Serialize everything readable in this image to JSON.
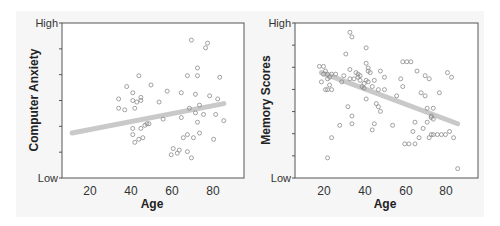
{
  "chart_data": [
    {
      "type": "scatter",
      "title": "",
      "xlabel": "Age",
      "ylabel": "Computer Anxiety",
      "xticks": [
        20,
        40,
        60,
        80
      ],
      "xlim": [
        6,
        96
      ],
      "yticks_labels": {
        "low": "Low",
        "high": "High"
      },
      "ylim": [
        0,
        10
      ],
      "y_minor_ticks": 5,
      "grid": false,
      "trend": {
        "direction": "positive",
        "x_start": 11,
        "y_start": 2.9,
        "x_end": 86,
        "y_end": 4.8
      },
      "points": [
        [
          34,
          5.1
        ],
        [
          34,
          4.5
        ],
        [
          37,
          4.4
        ],
        [
          38,
          5.9
        ],
        [
          41,
          5.5
        ],
        [
          41,
          5.0
        ],
        [
          42,
          4.5
        ],
        [
          43,
          4.9
        ],
        [
          44,
          6.6
        ],
        [
          45,
          5.2
        ],
        [
          45,
          5.0
        ],
        [
          50,
          6.0
        ],
        [
          54,
          4.9
        ],
        [
          58,
          5.6
        ],
        [
          65,
          5.5
        ],
        [
          68,
          6.6
        ],
        [
          70,
          8.9
        ],
        [
          77,
          8.4
        ],
        [
          78,
          8.7
        ],
        [
          73,
          7.1
        ],
        [
          73,
          6.6
        ],
        [
          84,
          6.5
        ],
        [
          79,
          5.3
        ],
        [
          83,
          5.1
        ],
        [
          72,
          5.4
        ],
        [
          69,
          4.5
        ],
        [
          72,
          4.2
        ],
        [
          74,
          4.7
        ],
        [
          76,
          4.1
        ],
        [
          82,
          4.1
        ],
        [
          86,
          3.7
        ],
        [
          73,
          3.6
        ],
        [
          65,
          3.9
        ],
        [
          56,
          3.8
        ],
        [
          41,
          3.2
        ],
        [
          45,
          3.2
        ],
        [
          47,
          3.4
        ],
        [
          48,
          3.5
        ],
        [
          49,
          3.5
        ],
        [
          41,
          2.8
        ],
        [
          42,
          2.3
        ],
        [
          44,
          2.5
        ],
        [
          46,
          2.6
        ],
        [
          66,
          2.6
        ],
        [
          68,
          2.8
        ],
        [
          71,
          2.6
        ],
        [
          74,
          2.9
        ],
        [
          81,
          2.5
        ],
        [
          61,
          1.9
        ],
        [
          63,
          1.6
        ],
        [
          64,
          1.8
        ],
        [
          60,
          1.5
        ],
        [
          68,
          1.7
        ],
        [
          70,
          1.3
        ]
      ]
    },
    {
      "type": "scatter",
      "title": "",
      "xlabel": "Age",
      "ylabel": "Memory Scores",
      "xticks": [
        20,
        40,
        60,
        80
      ],
      "xlim": [
        6,
        96
      ],
      "yticks_labels": {
        "low": "Low",
        "high": "High"
      },
      "ylim": [
        0,
        10
      ],
      "y_minor_ticks": 6,
      "grid": false,
      "trend": {
        "direction": "negative",
        "x_start": 19,
        "y_start": 6.8,
        "x_end": 86,
        "y_end": 3.5
      },
      "points": [
        [
          18,
          7.2
        ],
        [
          20,
          7.2
        ],
        [
          19,
          6.2
        ],
        [
          20,
          6.7
        ],
        [
          21,
          6.9
        ],
        [
          22,
          6.7
        ],
        [
          22,
          6.4
        ],
        [
          23,
          6.0
        ],
        [
          21,
          5.7
        ],
        [
          22,
          5.7
        ],
        [
          24,
          5.7
        ],
        [
          23,
          6.5
        ],
        [
          24,
          6.7
        ],
        [
          26,
          6.7
        ],
        [
          24,
          2.6
        ],
        [
          22,
          1.3
        ],
        [
          28,
          3.4
        ],
        [
          29,
          6.2
        ],
        [
          30,
          6.6
        ],
        [
          31,
          8.0
        ],
        [
          32,
          4.6
        ],
        [
          33,
          6.4
        ],
        [
          33,
          7.0
        ],
        [
          33,
          9.4
        ],
        [
          34,
          9.1
        ],
        [
          34,
          3.5
        ],
        [
          34,
          4.0
        ],
        [
          35,
          6.4
        ],
        [
          36,
          6.8
        ],
        [
          37,
          6.5
        ],
        [
          37,
          6.7
        ],
        [
          38,
          6.3
        ],
        [
          38,
          6.6
        ],
        [
          39,
          5.9
        ],
        [
          40,
          6.1
        ],
        [
          40,
          5.8
        ],
        [
          41,
          6.3
        ],
        [
          41,
          8.4
        ],
        [
          41,
          7.4
        ],
        [
          41,
          5.1
        ],
        [
          42,
          7.1
        ],
        [
          42,
          6.9
        ],
        [
          42,
          6.2
        ],
        [
          43,
          6.8
        ],
        [
          44,
          5.9
        ],
        [
          44,
          3.1
        ],
        [
          45,
          3.5
        ],
        [
          45,
          6.3
        ],
        [
          46,
          4.8
        ],
        [
          47,
          5.7
        ],
        [
          47,
          4.6
        ],
        [
          48,
          6.9
        ],
        [
          48,
          4.3
        ],
        [
          50,
          6.5
        ],
        [
          50,
          5.7
        ],
        [
          54,
          3.4
        ],
        [
          56,
          5.3
        ],
        [
          58,
          6.4
        ],
        [
          59,
          5.9
        ],
        [
          59,
          7.5
        ],
        [
          61,
          7.5
        ],
        [
          63,
          7.5
        ],
        [
          60,
          2.2
        ],
        [
          62,
          2.2
        ],
        [
          65,
          2.2
        ],
        [
          65,
          3.6
        ],
        [
          64,
          3.0
        ],
        [
          66,
          6.9
        ],
        [
          67,
          2.6
        ],
        [
          68,
          5.5
        ],
        [
          69,
          3.2
        ],
        [
          70,
          6.6
        ],
        [
          70,
          5.3
        ],
        [
          71,
          4.5
        ],
        [
          71,
          3.6
        ],
        [
          72,
          6.4
        ],
        [
          72,
          2.6
        ],
        [
          73,
          4.0
        ],
        [
          73,
          2.8
        ],
        [
          74,
          4.5
        ],
        [
          74,
          2.8
        ],
        [
          76,
          2.8
        ],
        [
          78,
          2.8
        ],
        [
          77,
          5.5
        ],
        [
          80,
          2.8
        ],
        [
          81,
          6.8
        ],
        [
          82,
          3.0
        ],
        [
          83,
          6.5
        ],
        [
          84,
          2.6
        ],
        [
          86,
          0.6
        ],
        [
          73,
          3.9
        ],
        [
          74,
          3.8
        ]
      ]
    }
  ],
  "charts": [
    {
      "ylabel": "Computer Anxiety",
      "xlabel": "Age",
      "y_high": "High",
      "y_low": "Low",
      "xtick_labels": [
        "20",
        "40",
        "60",
        "80"
      ]
    },
    {
      "ylabel": "Memory Scores",
      "xlabel": "Age",
      "y_high": "High",
      "y_low": "Low",
      "xtick_labels": [
        "20",
        "40",
        "60",
        "80"
      ]
    }
  ],
  "colors": {
    "panel_bg": "#f6f6f6",
    "plot_bg": "#ffffff",
    "frame": "#555555",
    "point_stroke": "#8a8a8a",
    "trend_line": "#c8c8c8",
    "text": "#222222"
  }
}
